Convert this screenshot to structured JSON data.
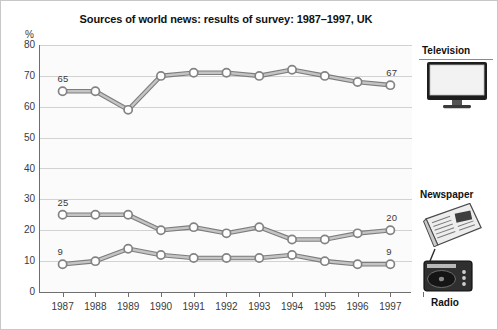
{
  "chart_data": {
    "type": "line",
    "title": "Sources of world news: results of survey: 1987–1997, UK",
    "xlabel": "",
    "ylabel": "%",
    "ylim": [
      0,
      80
    ],
    "ytick_step": 10,
    "yticks": [
      "0",
      "10",
      "20",
      "30",
      "40",
      "50",
      "60",
      "70",
      "80"
    ],
    "grid": true,
    "legend_position": "right",
    "categories": [
      "1987",
      "1988",
      "1989",
      "1990",
      "1991",
      "1992",
      "1993",
      "1994",
      "1995",
      "1996",
      "1997"
    ],
    "series": [
      {
        "name": "Television",
        "values": [
          65,
          65,
          59,
          70,
          71,
          71,
          70,
          72,
          70,
          68,
          67
        ],
        "endpoint_labels": {
          "start": "65",
          "end": "67"
        }
      },
      {
        "name": "Newspaper",
        "values": [
          25,
          25,
          25,
          20,
          21,
          19,
          21,
          17,
          17,
          19,
          20
        ],
        "endpoint_labels": {
          "start": "25",
          "end": "20"
        }
      },
      {
        "name": "Radio",
        "values": [
          9,
          10,
          14,
          12,
          11,
          11,
          11,
          12,
          10,
          9,
          9
        ],
        "endpoint_labels": {
          "start": "9",
          "end": "9"
        }
      }
    ],
    "line_color": "#9a9a9a",
    "marker_fill": "#ffffff",
    "marker_stroke": "#8e8e8e"
  },
  "legend": {
    "television": {
      "label": "Television",
      "icon": "television-icon"
    },
    "newspaper": {
      "label": "Newspaper",
      "icon": "newspaper-icon"
    },
    "radio": {
      "label": "Radio",
      "icon": "radio-icon"
    }
  },
  "axis": {
    "percent_symbol": "%"
  }
}
